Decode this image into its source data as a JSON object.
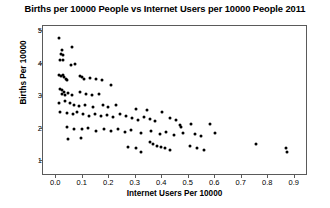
{
  "chart_data": {
    "type": "scatter",
    "title": "Births per 10000 People vs Internet Users per 10000 People 2011",
    "xlabel": "Internet Users Per 10000",
    "ylabel": "Births Per 10000",
    "xlim": [
      -0.05,
      0.95
    ],
    "ylim": [
      0.55,
      5.15
    ],
    "xticks": [
      0.0,
      0.1,
      0.2,
      0.3,
      0.4,
      0.5,
      0.6,
      0.7,
      0.8,
      0.9
    ],
    "xtick_labels": [
      "0.0",
      "0.1",
      "0.2",
      "0.3",
      "0.4",
      "0.5",
      "0.6",
      "0.7",
      "0.8",
      "0.9"
    ],
    "yticks": [
      1,
      2,
      3,
      4,
      5
    ],
    "ytick_labels": [
      "1",
      "2",
      "3",
      "4",
      "5"
    ],
    "grid": false,
    "legend": false,
    "marker": "circle",
    "marker_color": "#000000",
    "frame_color": "#5a5a5a",
    "background": "#ffffff",
    "points": [
      [
        0.012,
        4.78
      ],
      [
        0.02,
        4.42
      ],
      [
        0.017,
        4.3
      ],
      [
        0.026,
        4.26
      ],
      [
        0.016,
        4.12
      ],
      [
        0.027,
        4.1
      ],
      [
        0.06,
        4.52
      ],
      [
        0.072,
        4.0
      ],
      [
        0.055,
        3.96
      ],
      [
        0.009,
        3.66
      ],
      [
        0.018,
        3.62
      ],
      [
        0.024,
        3.64
      ],
      [
        0.03,
        3.58
      ],
      [
        0.036,
        3.54
      ],
      [
        0.042,
        3.5
      ],
      [
        0.09,
        3.62
      ],
      [
        0.098,
        3.58
      ],
      [
        0.104,
        3.52
      ],
      [
        0.128,
        3.56
      ],
      [
        0.15,
        3.54
      ],
      [
        0.174,
        3.5
      ],
      [
        0.014,
        3.22
      ],
      [
        0.022,
        3.18
      ],
      [
        0.03,
        3.14
      ],
      [
        0.02,
        3.06
      ],
      [
        0.034,
        3.04
      ],
      [
        0.046,
        3.1
      ],
      [
        0.058,
        3.02
      ],
      [
        0.088,
        3.12
      ],
      [
        0.112,
        3.06
      ],
      [
        0.136,
        3.02
      ],
      [
        0.16,
        3.08
      ],
      [
        0.206,
        3.34
      ],
      [
        0.01,
        2.8
      ],
      [
        0.032,
        2.84
      ],
      [
        0.05,
        2.78
      ],
      [
        0.066,
        2.74
      ],
      [
        0.084,
        2.7
      ],
      [
        0.108,
        2.72
      ],
      [
        0.14,
        2.66
      ],
      [
        0.176,
        2.74
      ],
      [
        0.196,
        2.68
      ],
      [
        0.226,
        2.72
      ],
      [
        0.016,
        2.52
      ],
      [
        0.04,
        2.48
      ],
      [
        0.062,
        2.44
      ],
      [
        0.078,
        2.52
      ],
      [
        0.102,
        2.46
      ],
      [
        0.124,
        2.4
      ],
      [
        0.146,
        2.44
      ],
      [
        0.168,
        2.38
      ],
      [
        0.19,
        2.42
      ],
      [
        0.214,
        2.36
      ],
      [
        0.24,
        2.46
      ],
      [
        0.264,
        2.4
      ],
      [
        0.286,
        2.34
      ],
      [
        0.308,
        2.28
      ],
      [
        0.33,
        2.36
      ],
      [
        0.352,
        2.3
      ],
      [
        0.374,
        2.24
      ],
      [
        0.3,
        2.62
      ],
      [
        0.342,
        2.56
      ],
      [
        0.398,
        2.52
      ],
      [
        0.43,
        2.34
      ],
      [
        0.452,
        2.26
      ],
      [
        0.466,
        2.12
      ],
      [
        0.47,
        2.04
      ],
      [
        0.04,
        2.04
      ],
      [
        0.068,
        2.0
      ],
      [
        0.096,
        1.98
      ],
      [
        0.12,
        2.02
      ],
      [
        0.15,
        1.94
      ],
      [
        0.182,
        1.98
      ],
      [
        0.206,
        1.92
      ],
      [
        0.232,
        2.0
      ],
      [
        0.258,
        1.9
      ],
      [
        0.282,
        1.96
      ],
      [
        0.32,
        1.86
      ],
      [
        0.356,
        1.92
      ],
      [
        0.39,
        1.84
      ],
      [
        0.414,
        1.9
      ],
      [
        0.444,
        1.82
      ],
      [
        0.478,
        1.88
      ],
      [
        0.51,
        2.14
      ],
      [
        0.524,
        1.84
      ],
      [
        0.548,
        1.78
      ],
      [
        0.58,
        2.16
      ],
      [
        0.6,
        1.86
      ],
      [
        0.352,
        1.58
      ],
      [
        0.366,
        1.54
      ],
      [
        0.38,
        1.48
      ],
      [
        0.396,
        1.44
      ],
      [
        0.412,
        1.4
      ],
      [
        0.43,
        1.34
      ],
      [
        0.27,
        1.44
      ],
      [
        0.3,
        1.4
      ],
      [
        0.318,
        1.28
      ],
      [
        0.506,
        1.48
      ],
      [
        0.53,
        1.42
      ],
      [
        0.556,
        1.36
      ],
      [
        0.046,
        1.7
      ],
      [
        0.094,
        1.72
      ],
      [
        0.752,
        1.52
      ],
      [
        0.868,
        1.42
      ],
      [
        0.87,
        1.28
      ]
    ]
  }
}
